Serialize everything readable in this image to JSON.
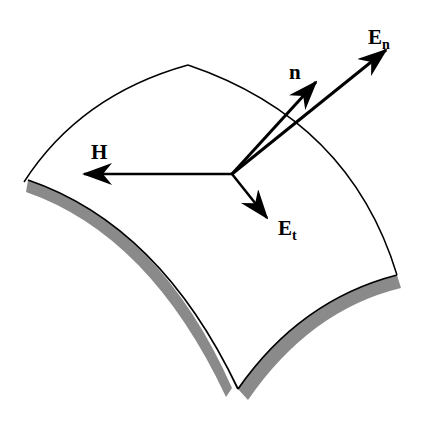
{
  "diagram": {
    "colors": {
      "line": "#000000",
      "shade": "#8a8a8a",
      "background": "#ffffff"
    },
    "labels": {
      "H": {
        "main": "H",
        "sub": ""
      },
      "n": {
        "main": "n",
        "sub": ""
      },
      "En": {
        "main": "E",
        "sub": "n"
      },
      "Et": {
        "main": "E",
        "sub": "t"
      }
    }
  }
}
